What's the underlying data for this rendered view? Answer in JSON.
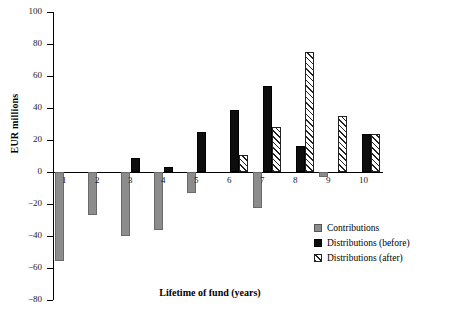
{
  "chart_data": {
    "type": "bar",
    "title": "",
    "xlabel": "Lifetime of fund (years)",
    "ylabel": "EUR millions",
    "categories": [
      "1",
      "2",
      "3",
      "4",
      "5",
      "6",
      "7",
      "8",
      "9",
      "10"
    ],
    "ylim": [
      -80,
      100
    ],
    "yticks": [
      100,
      80,
      60,
      40,
      20,
      0,
      -20,
      -40,
      -60,
      -80
    ],
    "ytick_labels": [
      "100",
      "80",
      "60",
      "40",
      "20",
      "0",
      "−20",
      "−40",
      "−60",
      "−80"
    ],
    "grid": false,
    "legend_position": "lower-right",
    "series": [
      {
        "name": "Contributions",
        "color": "#8c8c8c",
        "pattern": "solid-gray",
        "values": [
          -55.6,
          -27.0,
          -40.0,
          -36.5,
          -13.0,
          0,
          -22.5,
          0,
          -3.0,
          0
        ]
      },
      {
        "name": "Distributions (before)",
        "color": "#0d0d0d",
        "pattern": "solid-black",
        "values": [
          0,
          0,
          8.5,
          3.0,
          25.0,
          39.0,
          53.5,
          16.5,
          0,
          24.0
        ]
      },
      {
        "name": "Distributions (after)",
        "color": "#ffffff",
        "pattern": "diagonal-hatch",
        "values": [
          0,
          0,
          0,
          0,
          0,
          10.5,
          28.0,
          75.0,
          35.0,
          24.0
        ]
      }
    ]
  },
  "axis": {
    "y_label": "EUR millions",
    "x_label": "Lifetime of fund (years)"
  },
  "legend": {
    "items": [
      {
        "label": "Contributions"
      },
      {
        "label": "Distributions (before)"
      },
      {
        "label": "Distributions (after)"
      }
    ]
  }
}
